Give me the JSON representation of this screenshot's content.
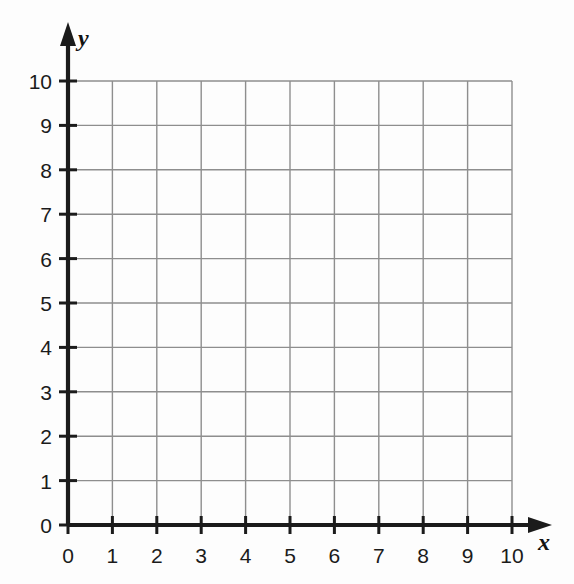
{
  "chart_data": {
    "type": "grid",
    "title": "",
    "subtitle": "",
    "xlabel": "x",
    "ylabel": "y",
    "xlim": [
      0,
      10
    ],
    "ylim": [
      0,
      10
    ],
    "x_ticks": [
      "0",
      "1",
      "2",
      "3",
      "4",
      "5",
      "6",
      "7",
      "8",
      "9",
      "10"
    ],
    "y_ticks": [
      "0",
      "1",
      "2",
      "3",
      "4",
      "5",
      "6",
      "7",
      "8",
      "9",
      "10"
    ],
    "x_tick_values": [
      0,
      1,
      2,
      3,
      4,
      5,
      6,
      7,
      8,
      9,
      10
    ],
    "y_tick_values": [
      0,
      1,
      2,
      3,
      4,
      5,
      6,
      7,
      8,
      9,
      10
    ],
    "grid": true,
    "grid_spacing": 1,
    "legend": null,
    "series": [],
    "annotations": []
  },
  "axes": {
    "x_axis_label": "x",
    "y_axis_label": "y",
    "origin_label": "0"
  },
  "colors": {
    "background": "#fdfdfd",
    "axis": "#1b1b1b",
    "grid_line": "#8e8e8e",
    "tick_text": "#1b1b1b",
    "axis_label_text": "#121212"
  }
}
